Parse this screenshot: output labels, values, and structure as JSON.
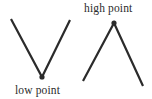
{
  "figure": {
    "background_color": "#ffffff",
    "stroke_color": "#2b2b2b",
    "text_color": "#2b2b2b",
    "width": 152,
    "height": 99,
    "labels": {
      "high_point": "high point",
      "low_point": "low point"
    },
    "shapes": [
      {
        "name": "v-shape-low-point",
        "kind": "polyline",
        "points": "11,19 42,77 70,20",
        "stroke_width": 2.2,
        "marker": {
          "name": "low-point-marker",
          "cx": 42,
          "cy": 77,
          "r": 2.6
        }
      },
      {
        "name": "inverted-v-shape-high-point",
        "kind": "polyline",
        "points": "83,81 114,23 143,86",
        "stroke_width": 2.2,
        "marker": {
          "name": "high-point-marker",
          "cx": 114,
          "cy": 23,
          "r": 2.6
        }
      }
    ]
  }
}
